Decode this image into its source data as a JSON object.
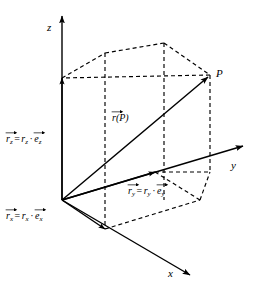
{
  "figure": {
    "type": "vector-diagram",
    "width": 264,
    "height": 290,
    "background": "#ffffff",
    "stroke_color": "#000000",
    "line_width": 1.2,
    "dash_pattern": "4,3"
  },
  "axes": [
    {
      "id": "z",
      "label": "z",
      "direction": "up",
      "label_x": 47,
      "label_y": 22
    },
    {
      "id": "y",
      "label": "y",
      "direction": "upper-right",
      "label_x": 231,
      "label_y": 160
    },
    {
      "id": "x",
      "label": "x",
      "direction": "lower-right",
      "label_x": 168,
      "label_y": 268
    }
  ],
  "origin": {
    "x": 62,
    "y": 200,
    "label": ""
  },
  "point": {
    "label": "P",
    "x": 210,
    "y": 75,
    "label_x": 216,
    "label_y": 68
  },
  "vectors": [
    {
      "id": "position",
      "name": "position-vector",
      "label_head": "r",
      "label_arg": "(P)",
      "label_x": 112,
      "label_y": 113,
      "from": "origin",
      "to": "P",
      "style": "solid"
    },
    {
      "id": "rz",
      "name": "z-component-vector",
      "label_lhs_head": "r",
      "label_lhs_sub": "z",
      "label_eq": "=",
      "label_scalar": "r",
      "label_scalar_sub": "z",
      "label_dot": "·",
      "label_unit": "e",
      "label_unit_sub": "z",
      "label_x": 6,
      "label_y": 134,
      "style": "solid"
    },
    {
      "id": "ry",
      "name": "y-component-vector",
      "label_lhs_head": "r",
      "label_lhs_sub": "y",
      "label_eq": "=",
      "label_scalar": "r",
      "label_scalar_sub": "y",
      "label_dot": "·",
      "label_unit": "e",
      "label_unit_sub": "y",
      "label_x": 128,
      "label_y": 186,
      "style": "solid"
    },
    {
      "id": "rx",
      "name": "x-component-vector",
      "label_lhs_head": "r",
      "label_lhs_sub": "x",
      "label_eq": "=",
      "label_scalar": "r",
      "label_scalar_sub": "x",
      "label_dot": "·",
      "label_unit": "e",
      "label_unit_sub": "x",
      "label_x": 6,
      "label_y": 211,
      "style": "solid"
    }
  ],
  "geometry": {
    "z_axis": {
      "x1": 62,
      "y1": 200,
      "x2": 62,
      "y2": 16
    },
    "y_axis": {
      "x1": 62,
      "y1": 200,
      "x2": 243,
      "y2": 146
    },
    "x_axis": {
      "x1": 62,
      "y1": 200,
      "x2": 190,
      "y2": 275
    },
    "rz_tip": {
      "x": 62,
      "y": 78
    },
    "ry_tip": {
      "x": 155,
      "y": 172
    },
    "rx_tip": {
      "x": 105,
      "y": 229
    },
    "box_top_front_left": {
      "x": 62,
      "y": 78
    },
    "box_top_back_left": {
      "x": 105,
      "y": 53
    },
    "box_top_back_right": {
      "x": 164,
      "y": 43
    },
    "box_top_front_right": {
      "x": 210,
      "y": 75
    },
    "box_bot_front_left": {
      "x": 62,
      "y": 200
    },
    "box_bot_back_left": {
      "x": 105,
      "y": 229
    },
    "box_bot_back_right": {
      "x": 200,
      "y": 200
    },
    "box_bot_front_right": {
      "x": 210,
      "y": 172
    }
  }
}
